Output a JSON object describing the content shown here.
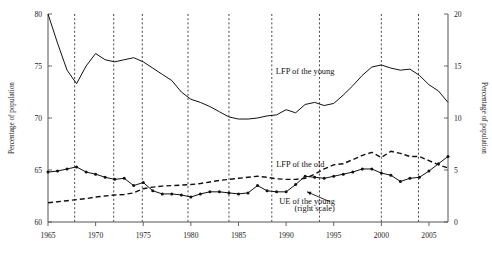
{
  "chart_data": {
    "type": "line",
    "title": "",
    "xlabel": "",
    "ylabel": "Percentage of population",
    "y2label": "Percentage of population",
    "xlim": [
      1965,
      2007
    ],
    "ylim": [
      60,
      80
    ],
    "y2lim": [
      0,
      20
    ],
    "xticks": [
      1965,
      1970,
      1975,
      1980,
      1985,
      1990,
      1995,
      2000,
      2005
    ],
    "xticklabels": [
      "1965",
      "1970",
      "1975",
      "1980",
      "1985",
      "1990",
      "1995",
      "2000",
      "2005"
    ],
    "yticks": [
      60,
      65,
      70,
      75,
      80
    ],
    "yticklabels": [
      "60",
      "65",
      "70",
      "75",
      "80"
    ],
    "y2ticks": [
      0,
      5,
      10,
      15,
      20
    ],
    "y2ticklabels": [
      "0",
      "5",
      "10",
      "15",
      "20"
    ],
    "grid": false,
    "legend_position": "inline-annotations",
    "annotations": [
      {
        "name": "lfp-young-label",
        "text": "LFP of the young",
        "x": 1992.0,
        "y": 74.2,
        "axis": "left"
      },
      {
        "name": "lfp-old-label",
        "text": "LFP of  the old",
        "x": 1991.5,
        "y": 65.3,
        "axis": "left"
      },
      {
        "name": "ue-young-label",
        "text": "UE of  the young",
        "x": 1992.2,
        "y": 61.75,
        "axis": "left"
      },
      {
        "name": "ue-young-sublabel",
        "text": "(right scale)",
        "x": 1993.0,
        "y": 61.05,
        "axis": "left"
      }
    ],
    "arrow": {
      "name": "ue-young-arrow",
      "from_x": 1994.6,
      "from_y": 61.95,
      "to_x": 1992.2,
      "to_y": 62.9,
      "axis": "left"
    },
    "recession_lines": [
      1967.8,
      1971.9,
      1974.9,
      1979.7,
      1984.0,
      1988.5,
      1993.5,
      2000.0,
      2003.9
    ],
    "x": [
      1965,
      1966,
      1967,
      1968,
      1969,
      1970,
      1971,
      1972,
      1973,
      1974,
      1975,
      1976,
      1977,
      1978,
      1979,
      1980,
      1981,
      1982,
      1983,
      1984,
      1985,
      1986,
      1987,
      1988,
      1989,
      1990,
      1991,
      1992,
      1993,
      1994,
      1995,
      1996,
      1997,
      1998,
      1999,
      2000,
      2001,
      2002,
      2003,
      2004,
      2005,
      2006,
      2007
    ],
    "series": [
      {
        "name": "LFP of the young",
        "axis": "left",
        "style": "solid",
        "markers": false,
        "values": [
          80.0,
          77.2,
          74.6,
          73.3,
          75.0,
          76.2,
          75.6,
          75.4,
          75.6,
          75.8,
          75.4,
          74.8,
          74.2,
          73.6,
          72.5,
          71.8,
          71.5,
          71.1,
          70.6,
          70.1,
          69.9,
          69.9,
          70.0,
          70.2,
          70.3,
          70.8,
          70.5,
          71.3,
          71.5,
          71.2,
          71.4,
          72.2,
          73.1,
          74.1,
          74.9,
          75.1,
          74.8,
          74.6,
          74.7,
          74.1,
          73.2,
          72.6,
          71.5
        ]
      },
      {
        "name": "LFP of  the old",
        "axis": "left",
        "style": "solid",
        "markers": true,
        "values": [
          64.8,
          64.9,
          65.1,
          65.3,
          64.8,
          64.6,
          64.3,
          64.1,
          64.2,
          63.5,
          63.8,
          63.0,
          62.7,
          62.7,
          62.6,
          62.4,
          62.7,
          62.9,
          62.9,
          62.8,
          62.7,
          62.8,
          63.5,
          63.0,
          62.9,
          62.9,
          63.6,
          64.4,
          64.3,
          64.2,
          64.4,
          64.6,
          64.8,
          65.1,
          65.1,
          64.7,
          64.5,
          63.9,
          64.2,
          64.3,
          64.9,
          65.6,
          66.3
        ]
      },
      {
        "name": "UE of  the young",
        "axis": "right",
        "style": "dashed",
        "markers": false,
        "values": [
          1.85,
          1.95,
          2.05,
          2.15,
          2.25,
          2.4,
          2.5,
          2.6,
          2.65,
          2.8,
          3.2,
          3.35,
          3.45,
          3.5,
          3.55,
          3.6,
          3.7,
          3.85,
          4.0,
          4.1,
          4.2,
          4.3,
          4.4,
          4.3,
          4.15,
          4.1,
          4.1,
          4.2,
          4.6,
          5.1,
          5.5,
          5.6,
          6.0,
          6.4,
          6.7,
          6.2,
          6.8,
          6.6,
          6.3,
          6.3,
          5.9,
          5.5,
          5.2
        ]
      }
    ]
  }
}
